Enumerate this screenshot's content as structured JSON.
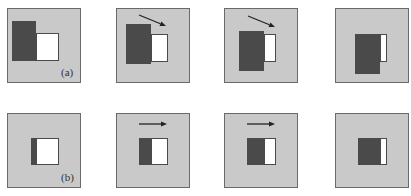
{
  "figure": {
    "rows": [
      {
        "label": "(a)",
        "panels": [
          {
            "x": 7,
            "y": 8,
            "dark": {
              "x": 4,
              "y": 12,
              "w": 24,
              "h": 40
            },
            "white": {
              "x": 28,
              "y": 24,
              "w": 23,
              "h": 28
            },
            "arrow": null
          },
          {
            "x": 116,
            "y": 8,
            "dark": {
              "x": 9,
              "y": 15,
              "w": 25,
              "h": 40
            },
            "white": {
              "x": 34,
              "y": 25,
              "w": 17,
              "h": 28
            },
            "arrow": {
              "x1": 23,
              "y1": 7,
              "x2": 50,
              "y2": 18
            }
          },
          {
            "x": 224,
            "y": 8,
            "dark": {
              "x": 14,
              "y": 22,
              "w": 25,
              "h": 40
            },
            "white": {
              "x": 39,
              "y": 25,
              "w": 12,
              "h": 28
            },
            "arrow": {
              "x1": 24,
              "y1": 8,
              "x2": 51,
              "y2": 19
            }
          },
          {
            "x": 335,
            "y": 8,
            "dark": {
              "x": 19,
              "y": 25,
              "w": 25,
              "h": 40
            },
            "white": {
              "x": 44,
              "y": 25,
              "w": 7,
              "h": 28
            },
            "arrow": null
          }
        ]
      },
      {
        "label": "(b)",
        "panels": [
          {
            "x": 7,
            "y": 113,
            "dark": {
              "x": 23,
              "y": 24,
              "w": 5,
              "h": 27
            },
            "white": {
              "x": 28,
              "y": 24,
              "w": 23,
              "h": 27
            },
            "arrow": null
          },
          {
            "x": 116,
            "y": 113,
            "dark": {
              "x": 22,
              "y": 24,
              "w": 12,
              "h": 27
            },
            "white": {
              "x": 34,
              "y": 24,
              "w": 17,
              "h": 27
            },
            "arrow": {
              "x1": 23,
              "y1": 11,
              "x2": 51,
              "y2": 11
            }
          },
          {
            "x": 224,
            "y": 113,
            "dark": {
              "x": 22,
              "y": 24,
              "w": 17,
              "h": 27
            },
            "white": {
              "x": 39,
              "y": 24,
              "w": 12,
              "h": 27
            },
            "arrow": {
              "x1": 23,
              "y1": 11,
              "x2": 51,
              "y2": 11
            }
          },
          {
            "x": 335,
            "y": 113,
            "dark": {
              "x": 22,
              "y": 24,
              "w": 22,
              "h": 27
            },
            "white": {
              "x": 44,
              "y": 24,
              "w": 7,
              "h": 27
            },
            "arrow": null
          }
        ]
      }
    ],
    "colors": {
      "panel_bg": "#c9c9c9",
      "dark": "#4a4a4a",
      "white": "#ffffff",
      "arrow": "#222222"
    }
  }
}
